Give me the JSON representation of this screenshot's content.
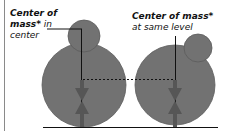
{
  "diagram": {
    "left_label": {
      "bold": "Center of",
      "bold2": "mass*",
      "italic_suffix": " in",
      "line3": "center"
    },
    "right_label": {
      "bold": "Center of mass*",
      "italic": "at same level"
    },
    "colors": {
      "shape_fill": "#707070",
      "shape_stroke": "#5a5a5a",
      "arrow": "#555555",
      "line": "#111111"
    }
  }
}
